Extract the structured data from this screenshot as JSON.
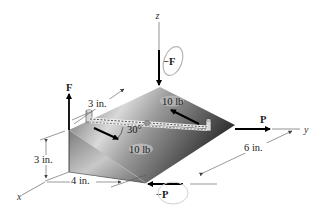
{
  "figure": {
    "type": "3D couple/moment diagram",
    "axes": {
      "x": "x",
      "y": "y",
      "z": "z"
    },
    "forces": {
      "F_up": "F",
      "F_down": "−F",
      "P_right": "P",
      "P_left": "−P",
      "rope_force_top": "10 lb",
      "rope_force_bottom": "10 lb"
    },
    "angle": "30°",
    "dimensions": {
      "height": "3 in.",
      "width": "4 in.",
      "peg_offset": "3 in.",
      "depth": "6 in."
    },
    "colors": {
      "block_top_light": "#cfcfcf",
      "block_top_dark": "#3a3a3a",
      "block_front": "#8a8a8a",
      "circulation_arrow": "#b5b5b5",
      "line": "#000000"
    }
  }
}
